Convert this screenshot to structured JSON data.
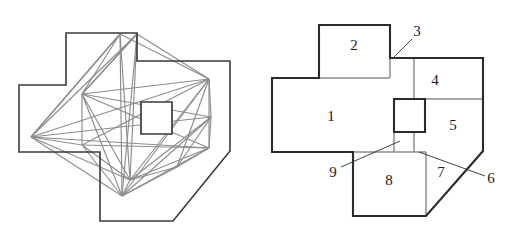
{
  "figure": {
    "title": "",
    "panels": [
      {
        "name": "left-panel",
        "caption": "",
        "description": "orthogonal polygon with square hole overlaid by gray triangulation network",
        "outline_color": "#3a3a3a",
        "mesh_color": "#8c8c8c",
        "hole_color": "#3a3a3a",
        "outline_points": "66,85 66,33 137,33 137,61 230,61 230,151 173,221 100,221 100,152 19,152 19,85",
        "hole_points": "141,102 172,102 172,134 141,134",
        "mesh_edges": [
          "82,94 130,180",
          "82,94 209,79",
          "82,94 209,148",
          "82,94 211,117",
          "82,94 122,196",
          "31,137 120,34",
          "31,137 209,79",
          "31,137 122,196",
          "31,137 130,180",
          "31,137 211,117",
          "31,137 209,148",
          "120,34 130,180",
          "120,34 122,196",
          "120,34 209,79",
          "120,34 82,94",
          "120,34 31,137",
          "137,34 130,180",
          "137,34 122,196",
          "137,34 209,79",
          "137,34 82,94",
          "209,79 209,148",
          "209,79 130,180",
          "209,79 122,196",
          "209,79 211,117",
          "209,148 130,180",
          "209,148 122,196",
          "209,148 211,117",
          "211,117 130,180",
          "211,117 122,196",
          "130,180 122,196",
          "82,94 137,34",
          "31,137 137,34",
          "82,145 209,148",
          "82,145 130,180",
          "82,145 31,137",
          "82,145 82,94",
          "82,145 122,196",
          "82,145 209,79",
          "177,167 209,148",
          "177,167 130,180",
          "177,167 122,196",
          "177,167 211,117",
          "177,167 209,79"
        ]
      },
      {
        "name": "right-panel",
        "caption": "",
        "description": "partition of the same polygon into nine labelled convex pieces",
        "outline_color": "#2b2b2b",
        "divider_color": "#8c8c8c",
        "leader_color": "#2b2b2b",
        "outline_points": "66,25 137,25 137,58 230,58 230,151 173,216 100,216 100,152 19,152 19,78 66,78",
        "hole_points": "141,99 172,99 172,132 141,132",
        "dividers": [
          "19,78 137,78",
          "137,58 137,78",
          "161,78 161,99",
          "161,58 161,78",
          "161,99 230,99",
          "141,132 161,132",
          "161,99 161,132",
          "100,152 173,152",
          "161,132 161,152",
          "141,132 141,152",
          "173,152 173,216"
        ],
        "regions": [
          {
            "id": "1",
            "label": "1",
            "label_x": 78,
            "label_y": 118
          },
          {
            "id": "2",
            "label": "2",
            "label_x": 101,
            "label_y": 47
          },
          {
            "id": "3",
            "label": "3",
            "label_x": 164,
            "label_y": 33
          },
          {
            "id": "4",
            "label": "4",
            "label_x": 182,
            "label_y": 82
          },
          {
            "id": "5",
            "label": "5",
            "label_x": 200,
            "label_y": 127
          },
          {
            "id": "6",
            "label": "6",
            "label_x": 238,
            "label_y": 180
          },
          {
            "id": "7",
            "label": "7",
            "label_x": 188,
            "label_y": 174
          },
          {
            "id": "8",
            "label": "8",
            "label_x": 136,
            "label_y": 182
          },
          {
            "id": "9",
            "label": "9",
            "label_x": 80,
            "label_y": 174
          }
        ],
        "leaders": [
          {
            "for": "3",
            "path": "159,39 139,59"
          },
          {
            "for": "9",
            "path": "88,167 147,141"
          },
          {
            "for": "6",
            "path": "232,176 166,152"
          }
        ]
      }
    ]
  }
}
